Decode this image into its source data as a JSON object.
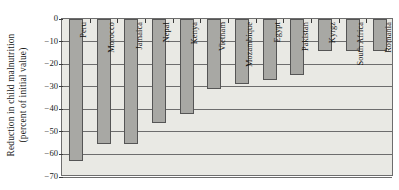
{
  "chart": {
    "type": "bar",
    "title": "",
    "ylabel_line1": "Reduction in child malnutrition",
    "ylabel_line2": "(percent of initial value)",
    "xlabel": "",
    "ylim": [
      -70,
      0
    ],
    "ytick_labels": [
      "0",
      "−10",
      "−20",
      "−30",
      "−40",
      "−50",
      "−60",
      "−70"
    ],
    "ytick_values": [
      0,
      -10,
      -20,
      -30,
      -40,
      -50,
      -60,
      -70
    ],
    "grid": "horizontal",
    "legend": "none",
    "bar_color": "#a8a8a4",
    "bar_edge_color": "#555555",
    "plot_background": "#e9e9e4",
    "axis_color": "#6d6d6d"
  },
  "chart_data": {
    "type": "bar",
    "title": "",
    "xlabel": "",
    "ylabel": "Reduction in child malnutrition (percent of initial value)",
    "ylim": [
      -70,
      0
    ],
    "grid": true,
    "legend_position": "none",
    "categories": [
      "Peru",
      "Morocco",
      "Jamaica",
      "Nepal",
      "Kenya",
      "Vietnam",
      "Mozambique",
      "Egypt",
      "Pakistan",
      "Kyrgz",
      "South Africa",
      "Romania"
    ],
    "values": [
      -63,
      -55.5,
      -55.5,
      -46,
      -42,
      -31,
      -29,
      -27,
      -25,
      -14,
      -14,
      -14
    ]
  }
}
